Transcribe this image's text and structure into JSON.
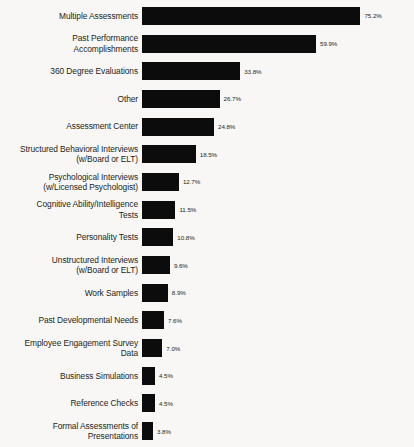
{
  "chart_data": {
    "type": "bar",
    "orientation": "horizontal",
    "title": "",
    "subtitle": "",
    "xlabel": "",
    "ylabel": "",
    "xlim": [
      0,
      80
    ],
    "grid": false,
    "legend": null,
    "value_suffix": "%",
    "bar_color": "#0d0c0c",
    "background_color": "#f8f7f5",
    "categories": [
      "Multiple Assessments",
      "Past Performance\nAccomplishments",
      "360 Degree Evaluations",
      "Other",
      "Assessment Center",
      "Structured Behavioral Interviews\n(w/Board or ELT)",
      "Psychological Interviews\n(w/Licensed Psychologist)",
      "Cognitive Ability/Intelligence\nTests",
      "Personality Tests",
      "Unstructured Interviews\n(w/Board or ELT)",
      "Work Samples",
      "Past Developmental Needs",
      "Employee Engagement Survey\nData",
      "Business Simulations",
      "Reference Checks",
      "Formal Assessments of\nPresentations"
    ],
    "values": [
      75.2,
      59.9,
      33.8,
      26.7,
      24.8,
      18.5,
      12.7,
      11.5,
      10.8,
      9.6,
      8.9,
      7.6,
      7.0,
      4.5,
      4.5,
      3.8
    ],
    "value_labels": [
      "75.2%",
      "59.9%",
      "33.8%",
      "26.7%",
      "24.8%",
      "18.5%",
      "12.7%",
      "11.5%",
      "10.8%",
      "9.6%",
      "8.9%",
      "7.6%",
      "7.0%",
      "4.5%",
      "4.5%",
      "3.8%"
    ]
  }
}
